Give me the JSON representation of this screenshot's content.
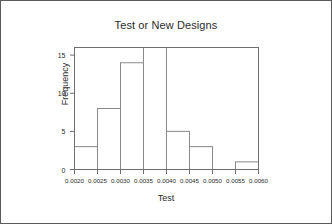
{
  "figure": {
    "background_color": "#ffffff",
    "border_color": "#5a5a5a",
    "axis_color": "#6e6e6e",
    "bar_edge_color": "#8a8a8a",
    "bar_fill_color": "#ffffff",
    "text_color": "#2b2b2b"
  },
  "chart_data": {
    "type": "bar",
    "title": "Test or New Designs",
    "xlabel": "Test",
    "ylabel": "Frequency",
    "categories": [
      "0.0020-0.0025",
      "0.0025-0.0030",
      "0.0030-0.0035",
      "0.0035-0.0040",
      "0.0040-0.0045",
      "0.0045-0.0050",
      "0.0050-0.0055",
      "0.0055-0.0060"
    ],
    "bin_edges": [
      0.002,
      0.0025,
      0.003,
      0.0035,
      0.004,
      0.0045,
      0.005,
      0.0055,
      0.006
    ],
    "values": [
      3,
      8,
      14,
      16,
      5,
      3,
      0,
      1
    ],
    "xlim": [
      0.002,
      0.006
    ],
    "ylim": [
      0,
      16
    ],
    "xticks": [
      0.002,
      0.0025,
      0.003,
      0.0035,
      0.004,
      0.0045,
      0.005,
      0.0055,
      0.006
    ],
    "xtick_labels": [
      "0.0020",
      "0.0025",
      "0.0030",
      "0.0035",
      "0.0040",
      "0.0045",
      "0.0050",
      "0.0055",
      "0.0060"
    ],
    "yticks": [
      0,
      5,
      10,
      15
    ],
    "ytick_labels": [
      "0",
      "5",
      "10",
      "15"
    ],
    "grid": false,
    "legend": null
  }
}
